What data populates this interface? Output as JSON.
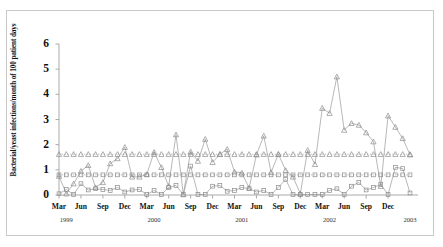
{
  "figure": {
    "border_color": "#c9c9c9",
    "background": "#ffffff"
  },
  "chart_data": {
    "type": "line",
    "title": "",
    "xlabel": "",
    "ylabel": "Bacterial/yeast infections/month of 100 patient days",
    "ylim": [
      0,
      6
    ],
    "yticks": [
      0,
      1,
      2,
      3,
      4,
      5,
      6
    ],
    "ytick_labels": [
      "0",
      "1",
      "2",
      "3",
      "4",
      "5",
      "6"
    ],
    "grid": false,
    "legend": "none",
    "axis_color": "#aaaaaa",
    "line_color": "#9a9a9a",
    "marker_color": "#8c8c8c",
    "x": [
      "Mar 1999",
      "Apr 1999",
      "May 1999",
      "Jun 1999",
      "Jul 1999",
      "Aug 1999",
      "Sep 1999",
      "Oct 1999",
      "Nov 1999",
      "Dec 1999",
      "Jan 2000",
      "Feb 2000",
      "Mar 2000",
      "Apr 2000",
      "May 2000",
      "Jun 2000",
      "Jul 2000",
      "Aug 2000",
      "Sep 2000",
      "Oct 2000",
      "Nov 2000",
      "Dec 2000",
      "Jan 2001",
      "Feb 2001",
      "Mar 2001",
      "Apr 2001",
      "May 2001",
      "Jun 2001",
      "Jul 2001",
      "Aug 2001",
      "Sep 2001",
      "Oct 2001",
      "Nov 2001",
      "Dec 2001",
      "Jan 2002",
      "Feb 2002",
      "Mar 2002",
      "Apr 2002",
      "May 2002",
      "Jun 2002",
      "Jul 2002",
      "Aug 2002",
      "Sep 2002",
      "Oct 2002",
      "Nov 2002",
      "Dec 2002",
      "Jan 2003",
      "Feb 2003",
      "Mar 2003"
    ],
    "xtick_labels": [
      "Mar",
      "Jun",
      "Sep",
      "Dec",
      "Mar",
      "Jun",
      "Sep",
      "Dec",
      "Mar",
      "Jun",
      "Sep",
      "Dec",
      "Mar",
      "Jun",
      "Sep",
      "Dec"
    ],
    "xtick_indices": [
      0,
      3,
      6,
      9,
      12,
      15,
      18,
      21,
      24,
      27,
      30,
      33,
      36,
      39,
      42,
      45
    ],
    "year_labels": [
      "1999",
      "2000",
      "2001",
      "2002",
      "2003"
    ],
    "year_indices": [
      1,
      13,
      25,
      37,
      48
    ],
    "series": [
      {
        "name": "bacterial-infection-rate",
        "marker": "triangle",
        "linestyle": "solid",
        "values": [
          0.75,
          0.05,
          0.45,
          0.95,
          1.18,
          0.3,
          0.5,
          1.25,
          1.45,
          1.9,
          0.72,
          0.72,
          0.82,
          1.7,
          1.1,
          0.35,
          2.4,
          0.02,
          1.72,
          1.35,
          2.22,
          1.3,
          1.62,
          1.82,
          0.92,
          0.88,
          0.28,
          1.6,
          2.35,
          0.9,
          1.62,
          0.98,
          0.72,
          0.05,
          1.78,
          1.22,
          3.45,
          3.25,
          4.7,
          2.58,
          2.85,
          2.78,
          2.48,
          2.12,
          0.35,
          3.15,
          2.7,
          2.25,
          1.6
        ]
      },
      {
        "name": "bacterial-infection-mean-reference",
        "marker": "triangle",
        "linestyle": "dotted",
        "constant": 1.62,
        "values": [
          1.62,
          1.62,
          1.62,
          1.62,
          1.62,
          1.62,
          1.62,
          1.62,
          1.62,
          1.62,
          1.62,
          1.62,
          1.62,
          1.62,
          1.62,
          1.62,
          1.62,
          1.62,
          1.62,
          1.62,
          1.62,
          1.62,
          1.62,
          1.62,
          1.62,
          1.62,
          1.62,
          1.62,
          1.62,
          1.62,
          1.62,
          1.62,
          1.62,
          1.62,
          1.62,
          1.62,
          1.62,
          1.62,
          1.62,
          1.62,
          1.62,
          1.62,
          1.62,
          1.62,
          1.62,
          1.62,
          1.62,
          1.62,
          1.62
        ]
      },
      {
        "name": "yeast-infection-mean-reference",
        "marker": "square",
        "linestyle": "dotted",
        "constant": 0.8,
        "values": [
          0.8,
          0.8,
          0.8,
          0.8,
          0.8,
          0.8,
          0.8,
          0.8,
          0.8,
          0.8,
          0.8,
          0.8,
          0.8,
          0.8,
          0.8,
          0.8,
          0.8,
          0.8,
          0.8,
          0.8,
          0.8,
          0.8,
          0.8,
          0.8,
          0.8,
          0.8,
          0.8,
          0.8,
          0.8,
          0.8,
          0.8,
          0.8,
          0.8,
          0.8,
          0.8,
          0.8,
          0.8,
          0.8,
          0.8,
          0.8,
          0.8,
          0.8,
          0.8,
          0.8,
          0.8,
          0.8,
          0.8,
          0.8,
          0.8
        ]
      },
      {
        "name": "yeast-infection-rate",
        "marker": "square",
        "linestyle": "solid",
        "values": [
          0.05,
          0.22,
          0.02,
          0.45,
          0.2,
          0.25,
          0.22,
          0.18,
          0.3,
          0.12,
          0.2,
          0.22,
          0.02,
          0.18,
          0.02,
          0.3,
          0.38,
          0.02,
          1.15,
          0.02,
          0.02,
          0.35,
          0.38,
          0.15,
          0.18,
          0.3,
          0.25,
          0.12,
          0.18,
          0.02,
          0.3,
          0.62,
          0.02,
          0.02,
          0.02,
          0.02,
          0.02,
          0.18,
          0.25,
          0.02,
          0.35,
          0.5,
          0.2,
          0.3,
          0.42,
          0.02,
          1.1,
          1.05,
          0.08
        ]
      }
    ]
  }
}
